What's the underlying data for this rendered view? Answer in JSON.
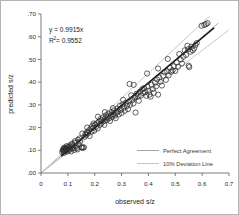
{
  "chart_data": {
    "type": "scatter",
    "title": "",
    "xlabel": "observed s/z",
    "ylabel": "predicted s/z",
    "xlim": [
      0,
      0.7
    ],
    "ylim": [
      0,
      0.7
    ],
    "grid": false,
    "xticks": [
      "0",
      "0.1",
      "0.2",
      "0.3",
      "0.4",
      "0.5",
      "0.6",
      "0.7"
    ],
    "xtick_values": [
      0,
      0.1,
      0.2,
      0.3,
      0.4,
      0.5,
      0.6,
      0.7
    ],
    "yticks": [
      ".00",
      ".10",
      ".20",
      ".30",
      ".40",
      ".50",
      ".60",
      ".70"
    ],
    "ytick_values": [
      0,
      0.1,
      0.2,
      0.3,
      0.4,
      0.5,
      0.6,
      0.7
    ],
    "annotations": {
      "equation": "y = 0.9915x",
      "r_squared_prefix": "R",
      "r_squared_sup": "2",
      "r_squared_value": " = 0.9552"
    },
    "legend": {
      "position": "lower-right",
      "entries": [
        {
          "label": "Perfect Agreement",
          "color": "#9a9a9a",
          "style": "solid"
        },
        {
          "label": "10% Deviation Line",
          "color": "#b9b9b9",
          "style": "solid"
        }
      ]
    },
    "fit_line": {
      "slope": 0.9915,
      "intercept": 0,
      "color": "#111111",
      "x_start": 0.075,
      "x_end": 0.645
    },
    "identity_line": {
      "slope": 1.0,
      "intercept": 0,
      "color": "#a8a8a8",
      "x_start": 0.0,
      "x_end": 0.66
    },
    "deviation_lines": [
      {
        "name": "+10%",
        "slope": 1.1,
        "intercept": 0,
        "color": "#c2c2c2",
        "x_start": 0.0,
        "x_end": 0.63
      },
      {
        "name": "-10%",
        "slope": 0.9,
        "intercept": 0,
        "color": "#c2c2c2",
        "x_start": 0.0,
        "x_end": 0.7
      }
    ],
    "marker": {
      "shape": "open-circle",
      "size": 2.6,
      "edge_color": "#2e2e2e",
      "face_color": "none"
    },
    "points": [
      [
        0.079,
        0.092
      ],
      [
        0.081,
        0.1
      ],
      [
        0.083,
        0.104
      ],
      [
        0.084,
        0.097
      ],
      [
        0.085,
        0.11
      ],
      [
        0.086,
        0.089
      ],
      [
        0.088,
        0.103
      ],
      [
        0.089,
        0.112
      ],
      [
        0.09,
        0.096
      ],
      [
        0.092,
        0.108
      ],
      [
        0.093,
        0.101
      ],
      [
        0.095,
        0.118
      ],
      [
        0.097,
        0.094
      ],
      [
        0.099,
        0.106
      ],
      [
        0.101,
        0.113
      ],
      [
        0.103,
        0.099
      ],
      [
        0.106,
        0.121
      ],
      [
        0.108,
        0.104
      ],
      [
        0.11,
        0.116
      ],
      [
        0.112,
        0.095
      ],
      [
        0.115,
        0.11
      ],
      [
        0.118,
        0.126
      ],
      [
        0.121,
        0.108
      ],
      [
        0.124,
        0.101
      ],
      [
        0.127,
        0.133
      ],
      [
        0.13,
        0.118
      ],
      [
        0.133,
        0.11
      ],
      [
        0.136,
        0.104
      ],
      [
        0.14,
        0.126
      ],
      [
        0.143,
        0.152
      ],
      [
        0.146,
        0.139
      ],
      [
        0.15,
        0.113
      ],
      [
        0.153,
        0.112
      ],
      [
        0.156,
        0.111
      ],
      [
        0.16,
        0.113
      ],
      [
        0.163,
        0.16
      ],
      [
        0.166,
        0.173
      ],
      [
        0.169,
        0.168
      ],
      [
        0.172,
        0.18
      ],
      [
        0.175,
        0.176
      ],
      [
        0.178,
        0.188
      ],
      [
        0.181,
        0.163
      ],
      [
        0.185,
        0.196
      ],
      [
        0.188,
        0.183
      ],
      [
        0.191,
        0.208
      ],
      [
        0.195,
        0.199
      ],
      [
        0.198,
        0.186
      ],
      [
        0.201,
        0.213
      ],
      [
        0.205,
        0.204
      ],
      [
        0.208,
        0.219
      ],
      [
        0.211,
        0.196
      ],
      [
        0.215,
        0.226
      ],
      [
        0.218,
        0.212
      ],
      [
        0.221,
        0.237
      ],
      [
        0.224,
        0.218
      ],
      [
        0.227,
        0.232
      ],
      [
        0.23,
        0.245
      ],
      [
        0.233,
        0.228
      ],
      [
        0.236,
        0.212
      ],
      [
        0.239,
        0.24
      ],
      [
        0.242,
        0.254
      ],
      [
        0.245,
        0.233
      ],
      [
        0.248,
        0.246
      ],
      [
        0.251,
        0.262
      ],
      [
        0.254,
        0.241
      ],
      [
        0.257,
        0.229
      ],
      [
        0.26,
        0.255
      ],
      [
        0.263,
        0.268
      ],
      [
        0.266,
        0.247
      ],
      [
        0.269,
        0.259
      ],
      [
        0.272,
        0.276
      ],
      [
        0.275,
        0.253
      ],
      [
        0.278,
        0.241
      ],
      [
        0.281,
        0.266
      ],
      [
        0.284,
        0.284
      ],
      [
        0.287,
        0.271
      ],
      [
        0.29,
        0.258
      ],
      [
        0.294,
        0.296
      ],
      [
        0.297,
        0.279
      ],
      [
        0.3,
        0.264
      ],
      [
        0.304,
        0.302
      ],
      [
        0.308,
        0.288
      ],
      [
        0.312,
        0.274
      ],
      [
        0.316,
        0.309
      ],
      [
        0.32,
        0.295
      ],
      [
        0.324,
        0.281
      ],
      [
        0.328,
        0.316
      ],
      [
        0.332,
        0.3
      ],
      [
        0.336,
        0.342
      ],
      [
        0.34,
        0.322
      ],
      [
        0.344,
        0.306
      ],
      [
        0.348,
        0.331
      ],
      [
        0.352,
        0.266
      ],
      [
        0.356,
        0.349
      ],
      [
        0.36,
        0.336
      ],
      [
        0.364,
        0.318
      ],
      [
        0.33,
        0.392
      ],
      [
        0.345,
        0.388
      ],
      [
        0.368,
        0.358
      ],
      [
        0.372,
        0.341
      ],
      [
        0.376,
        0.368
      ],
      [
        0.38,
        0.352
      ],
      [
        0.384,
        0.374
      ],
      [
        0.388,
        0.356
      ],
      [
        0.392,
        0.34
      ],
      [
        0.396,
        0.38
      ],
      [
        0.4,
        0.362
      ],
      [
        0.404,
        0.345
      ],
      [
        0.408,
        0.336
      ],
      [
        0.412,
        0.389
      ],
      [
        0.416,
        0.37
      ],
      [
        0.42,
        0.353
      ],
      [
        0.395,
        0.438
      ],
      [
        0.424,
        0.398
      ],
      [
        0.428,
        0.381
      ],
      [
        0.432,
        0.412
      ],
      [
        0.436,
        0.345
      ],
      [
        0.44,
        0.42
      ],
      [
        0.445,
        0.402
      ],
      [
        0.45,
        0.385
      ],
      [
        0.455,
        0.428
      ],
      [
        0.46,
        0.444
      ],
      [
        0.465,
        0.41
      ],
      [
        0.47,
        0.448
      ],
      [
        0.475,
        0.43
      ],
      [
        0.48,
        0.463
      ],
      [
        0.485,
        0.446
      ],
      [
        0.49,
        0.452
      ],
      [
        0.495,
        0.47
      ],
      [
        0.5,
        0.449
      ],
      [
        0.505,
        0.487
      ],
      [
        0.51,
        0.468
      ],
      [
        0.515,
        0.524
      ],
      [
        0.52,
        0.5
      ],
      [
        0.525,
        0.482
      ],
      [
        0.53,
        0.512
      ],
      [
        0.535,
        0.54
      ],
      [
        0.54,
        0.52
      ],
      [
        0.545,
        0.56
      ],
      [
        0.548,
        0.545
      ],
      [
        0.55,
        0.472
      ],
      [
        0.552,
        0.466
      ],
      [
        0.556,
        0.534
      ],
      [
        0.56,
        0.556
      ],
      [
        0.565,
        0.54
      ],
      [
        0.57,
        0.548
      ],
      [
        0.575,
        0.563
      ],
      [
        0.58,
        0.572
      ],
      [
        0.598,
        0.648
      ],
      [
        0.608,
        0.652
      ],
      [
        0.614,
        0.655
      ],
      [
        0.62,
        0.66
      ],
      [
        0.472,
        0.502
      ],
      [
        0.436,
        0.46
      ],
      [
        0.35,
        0.335
      ],
      [
        0.306,
        0.322
      ],
      [
        0.268,
        0.286
      ],
      [
        0.238,
        0.268
      ],
      [
        0.212,
        0.248
      ],
      [
        0.196,
        0.218
      ],
      [
        0.172,
        0.2
      ],
      [
        0.154,
        0.174
      ],
      [
        0.138,
        0.146
      ],
      [
        0.126,
        0.14
      ],
      [
        0.114,
        0.128
      ],
      [
        0.102,
        0.115
      ],
      [
        0.094,
        0.107
      ],
      [
        0.087,
        0.098
      ]
    ]
  }
}
